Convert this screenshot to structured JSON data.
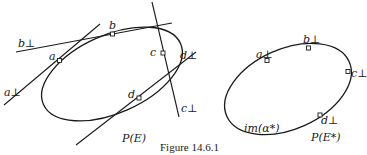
{
  "figure": {
    "caption": "Figure 14.6.1",
    "left_panel": {
      "space_label": "P(E)",
      "points": [
        {
          "id": "a",
          "label": "a"
        },
        {
          "id": "b",
          "label": "b"
        },
        {
          "id": "c",
          "label": "c"
        },
        {
          "id": "d",
          "label": "d"
        }
      ],
      "tangent_lines": [
        {
          "id": "a_perp",
          "label": "a⊥"
        },
        {
          "id": "b_perp",
          "label": "b⊥"
        },
        {
          "id": "c_perp",
          "label": "c⊥"
        },
        {
          "id": "d_perp",
          "label": "d⊥"
        }
      ]
    },
    "right_panel": {
      "space_label": "P(E*)",
      "curve_label": "im(α*)",
      "points": [
        {
          "id": "a_perp",
          "label": "a⊥"
        },
        {
          "id": "b_perp",
          "label": "b⊥"
        },
        {
          "id": "c_perp",
          "label": "c⊥"
        },
        {
          "id": "d_perp",
          "label": "d⊥"
        }
      ]
    }
  }
}
